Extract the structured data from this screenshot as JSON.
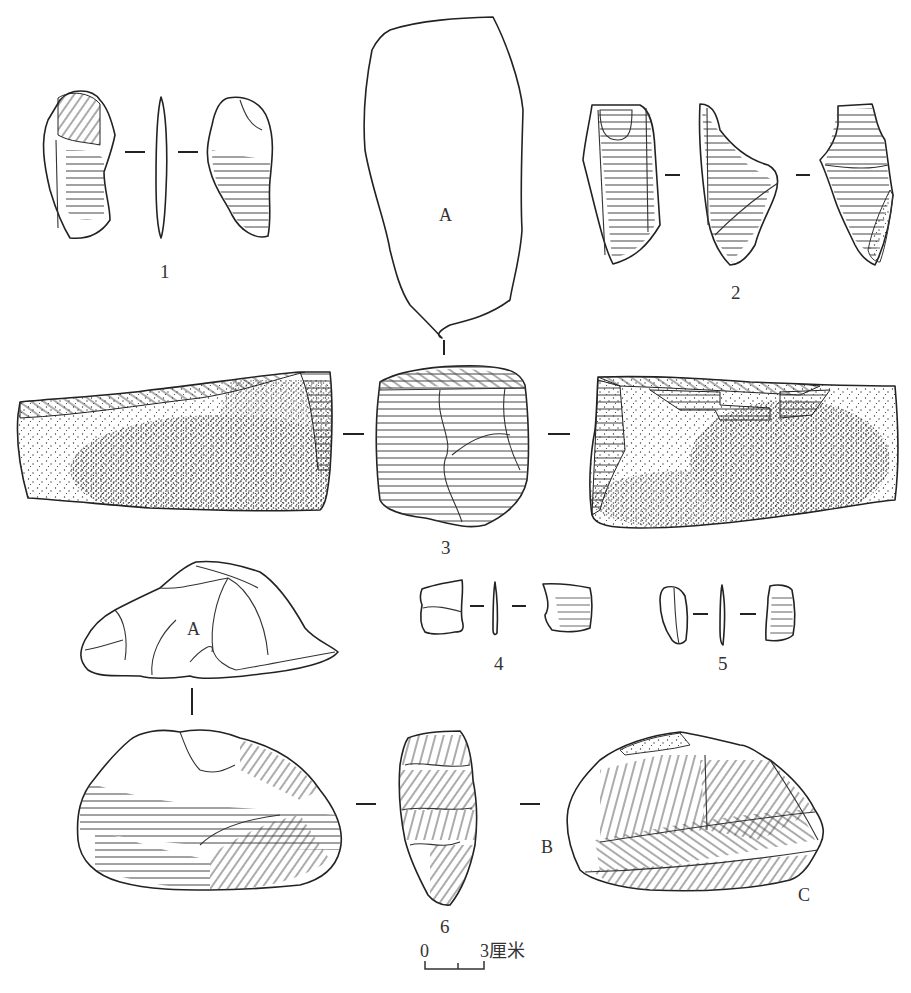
{
  "figure": {
    "type": "archaeological stone artifact drawing plate",
    "artifacts": [
      {
        "number": "1",
        "views": 3,
        "label": "1"
      },
      {
        "number": "2",
        "views": 3,
        "label": "2"
      },
      {
        "number": "3",
        "views": 4,
        "label": "3",
        "face_labels": [
          "A"
        ]
      },
      {
        "number": "4",
        "views": 3,
        "label": "4"
      },
      {
        "number": "5",
        "views": 3,
        "label": "5"
      },
      {
        "number": "6",
        "views": 4,
        "label": "6",
        "face_labels": [
          "A",
          "B",
          "C"
        ]
      }
    ],
    "labels": {
      "n1": "1",
      "n2": "2",
      "n3": "3",
      "n4": "4",
      "n5": "5",
      "n6": "6",
      "face_a_top": "A",
      "face_a_bottom": "A",
      "face_b": "B",
      "face_c": "C"
    },
    "scale_bar": {
      "start": "0",
      "end": "3厘米",
      "unit": "厘米",
      "length_cm": 3
    }
  }
}
